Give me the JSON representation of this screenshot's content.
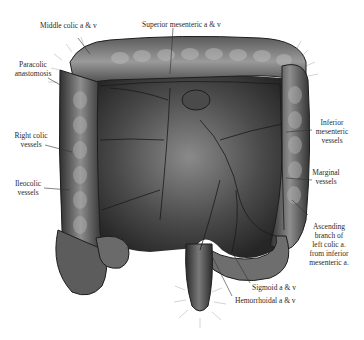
{
  "figure": {
    "colors": {
      "background": "#ffffff",
      "ink": "#1e1e1e",
      "label_text": "#2a2a2a",
      "leader_line": "#333333"
    }
  },
  "labels": {
    "middle_colic": "Middle colic a & v",
    "superior_mesenteric": "Superior mesenteric a & v",
    "paracolic_1": "Paracolic",
    "paracolic_2": "anastomosis",
    "right_colic_1": "Right colic",
    "right_colic_2": "vessels",
    "ileocolic_1": "Ileocolic",
    "ileocolic_2": "vessels",
    "inferior_mesenteric_1": "Inferior",
    "inferior_mesenteric_2": "mesenteric",
    "inferior_mesenteric_3": "vessels",
    "marginal_1": "Marginal",
    "marginal_2": "vessels",
    "ascending_1": "Ascending",
    "ascending_2": "branch of",
    "ascending_3": "left colic a.",
    "ascending_4": "from inferior",
    "ascending_5": "mesenteric a.",
    "sigmoid": "Sigmoid a & v",
    "hemorrhoidal": "Hemorrhoidal a & v"
  }
}
